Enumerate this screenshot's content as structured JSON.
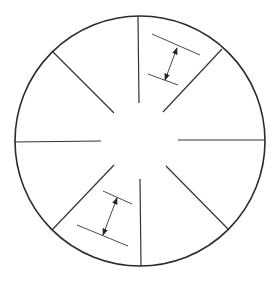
{
  "diagram": {
    "type": "radial-sector-diagram",
    "colors": {
      "background": "#ffffff",
      "rim": "#2a2a2a",
      "spoke": "#333333",
      "dimension_line": "#4a4a4a",
      "arrow": "#333333"
    },
    "circle": {
      "cx": 140,
      "cy": 141,
      "r": 125
    },
    "spokes": [
      {
        "name": "spoke-top",
        "x1": 138,
        "y1": 16,
        "x2": 139,
        "y2": 103
      },
      {
        "name": "spoke-top-right",
        "x1": 222,
        "y1": 49,
        "x2": 163,
        "y2": 112
      },
      {
        "name": "spoke-right",
        "x1": 265,
        "y1": 140,
        "x2": 178,
        "y2": 140
      },
      {
        "name": "spoke-bottom-right",
        "x1": 228,
        "y1": 229,
        "x2": 166,
        "y2": 166
      },
      {
        "name": "spoke-bottom",
        "x1": 141,
        "y1": 266,
        "x2": 140,
        "y2": 179
      },
      {
        "name": "spoke-bottom-left",
        "x1": 52,
        "y1": 230,
        "x2": 114,
        "y2": 165
      },
      {
        "name": "spoke-left",
        "x1": 14,
        "y1": 142,
        "x2": 101,
        "y2": 141
      },
      {
        "name": "spoke-top-left",
        "x1": 52,
        "y1": 51,
        "x2": 114,
        "y2": 113
      }
    ],
    "dimension_annotations": [
      {
        "name": "dimension-top-right",
        "sector": "between top and top-right spokes",
        "upper_line": {
          "x1": 152,
          "y1": 34,
          "x2": 200,
          "y2": 55
        },
        "lower_line": {
          "x1": 148,
          "y1": 74,
          "x2": 178,
          "y2": 85
        },
        "arrow": {
          "x1": 177,
          "y1": 48,
          "x2": 165,
          "y2": 80,
          "heads": "both"
        }
      },
      {
        "name": "dimension-bottom-left",
        "sector": "between bottom-left and bottom spokes",
        "upper_line": {
          "x1": 103,
          "y1": 191,
          "x2": 132,
          "y2": 204
        },
        "lower_line": {
          "x1": 77,
          "y1": 225,
          "x2": 128,
          "y2": 246
        },
        "arrow": {
          "x1": 117,
          "y1": 198,
          "x2": 103,
          "y2": 235,
          "heads": "both"
        }
      }
    ]
  }
}
